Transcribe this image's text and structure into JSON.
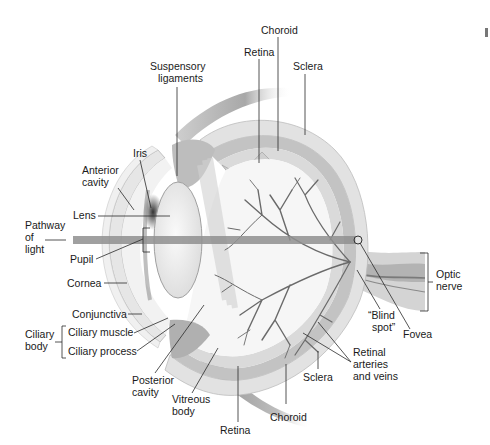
{
  "diagram": {
    "colors": {
      "background": "#ffffff",
      "sclera": "#e4e4e4",
      "choroid": "#bdbdbd",
      "retina": "#d2d2d2",
      "lens": "#efefef",
      "light_path": "#8f8f8f",
      "vessels": "#6a6a6a",
      "text": "#1a1a1a"
    },
    "labels": {
      "choroid_top": "Choroid",
      "retina_top": "Retina",
      "sclera_top": "Sclera",
      "suspensory_ligaments": [
        "Suspensory",
        "ligaments"
      ],
      "iris": "Iris",
      "anterior_cavity": [
        "Anterior",
        "cavity"
      ],
      "lens": "Lens",
      "pathway_of_light": [
        "Pathway",
        "of",
        "light"
      ],
      "pupil": "Pupil",
      "cornea": "Cornea",
      "conjunctiva": "Conjunctiva",
      "ciliary_body": [
        "Ciliary",
        "body"
      ],
      "ciliary_muscle": "Ciliary muscle",
      "ciliary_process": "Ciliary process",
      "posterior_cavity": [
        "Posterior",
        "cavity"
      ],
      "vitreous_body": [
        "Vitreous",
        "body"
      ],
      "retina_bottom": "Retina",
      "choroid_bottom": "Choroid",
      "sclera_bottom": "Sclera",
      "retinal_arteries_veins": [
        "Retinal",
        "arteries",
        "and veins"
      ],
      "blind_spot": [
        "“Blind",
        "spot”"
      ],
      "fovea": "Fovea",
      "optic_nerve": [
        "Optic",
        "nerve"
      ]
    }
  }
}
